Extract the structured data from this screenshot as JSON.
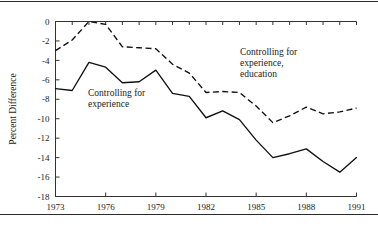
{
  "figure": {
    "has_top_rule": true,
    "has_bottom_rule": true,
    "background": "#ffffff",
    "line_color": "#111111",
    "axis_color": "#333333"
  },
  "chart_data": {
    "type": "line",
    "title": "",
    "xlabel": "",
    "ylabel": "Percent Difference",
    "xlim": [
      1973,
      1991
    ],
    "ylim": [
      -18,
      0
    ],
    "yticks": [
      0,
      -2,
      -4,
      -6,
      -8,
      -10,
      -12,
      -14,
      -16,
      -18
    ],
    "ytick_labels": [
      "0",
      "-2",
      "-4",
      "-6",
      "-8",
      "-10",
      "-12",
      "-14",
      "-16",
      "-18"
    ],
    "xticks": [
      1973,
      1974,
      1975,
      1976,
      1977,
      1978,
      1979,
      1980,
      1981,
      1982,
      1983,
      1984,
      1985,
      1986,
      1987,
      1988,
      1989,
      1990,
      1991
    ],
    "xtick_labels": [
      "1973",
      "",
      "",
      "1976",
      "",
      "",
      "1979",
      "",
      "",
      "1982",
      "",
      "",
      "1985",
      "",
      "",
      "1988",
      "",
      "",
      "1991"
    ],
    "xtick_labeled_years": [
      1973,
      1976,
      1979,
      1982,
      1985,
      1988,
      1991
    ],
    "grid": false,
    "legend": "annotations",
    "x": [
      1973,
      1974,
      1975,
      1976,
      1977,
      1978,
      1979,
      1980,
      1981,
      1982,
      1983,
      1984,
      1985,
      1986,
      1987,
      1988,
      1989,
      1990,
      1991
    ],
    "series": [
      {
        "name": "Controlling for experience",
        "style": "solid",
        "values": [
          -6.9,
          -7.1,
          -4.2,
          -4.7,
          -6.3,
          -6.2,
          -5.0,
          -7.4,
          -7.7,
          -9.9,
          -9.2,
          -10.1,
          -12.2,
          -14.0,
          -13.6,
          -13.1,
          -14.4,
          -15.5,
          -14.0
        ]
      },
      {
        "name": "Controlling for experience, education",
        "style": "dashed",
        "values": [
          -3.0,
          -1.9,
          0.0,
          -0.3,
          -2.6,
          -2.7,
          -2.8,
          -4.4,
          -5.3,
          -7.3,
          -7.2,
          -7.3,
          -8.7,
          -10.4,
          -9.7,
          -8.8,
          -9.5,
          -9.3,
          -8.9
        ]
      }
    ],
    "annotations": [
      {
        "name": "annotation-solid",
        "lines": [
          "Controlling for",
          "experience"
        ],
        "x_px": 88,
        "y_px": 96
      },
      {
        "name": "annotation-dashed",
        "lines": [
          "Controlling for",
          "experience,",
          "education"
        ],
        "x_px": 240,
        "y_px": 55
      }
    ]
  }
}
